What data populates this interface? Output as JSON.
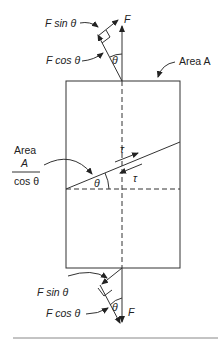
{
  "diagram": {
    "top_labels": {
      "force": "F",
      "f_sin": "F sin θ",
      "f_cos": "F cos θ",
      "angle": "θ",
      "area": "Area A"
    },
    "middle_labels": {
      "area_word": "Area",
      "area_num": "A",
      "area_den": "cos θ",
      "tau_upper": "τ",
      "tau_lower": "τ",
      "angle": "θ"
    },
    "bottom_labels": {
      "force": "F",
      "f_sin": "F sin θ",
      "f_cos": "F cos θ",
      "angle": "θ"
    },
    "colors": {
      "line": "#333333",
      "background": "#ffffff"
    }
  }
}
